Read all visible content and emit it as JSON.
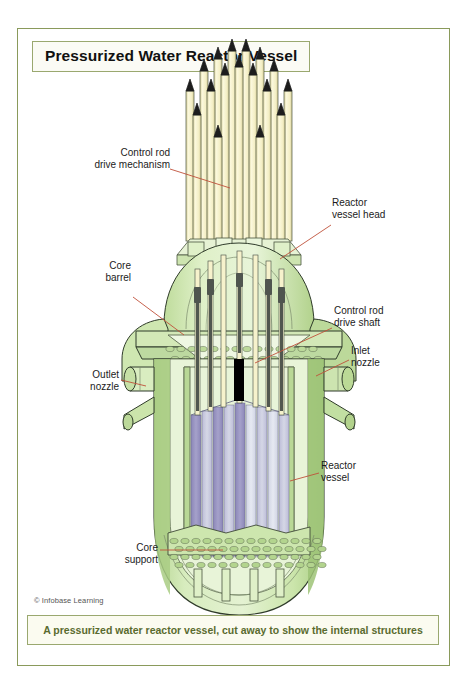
{
  "figure": {
    "title": "Pressurized Water Reactor Vessel",
    "caption": "A pressurized water reactor vessel, cut away to show the internal structures",
    "credit": "© Infobase Learning"
  },
  "colors": {
    "frame_border": "#8a9a5b",
    "title_border": "#9aa86f",
    "caption_text": "#5a6b2f",
    "caption_bg": "#fbfbf0",
    "vessel_green_light": "#dff0c8",
    "vessel_green_mid": "#c9e2a8",
    "vessel_green_dark": "#a9cd84",
    "rod_cream": "#f7f3cf",
    "rod_cream_dark": "#e8e2ad",
    "fuel_purple": "#9b97c4",
    "fuel_lavender": "#c6c6de",
    "fuel_pale": "#dfe2ee",
    "outline": "#2f3b2a",
    "leader_line": "#c0503a",
    "rod_tip_dark": "#1a1a1a",
    "shaft_grey": "#555a55",
    "black_marker": "#000000"
  },
  "callouts": [
    {
      "id": "control-rod-drive-mechanism",
      "label_line_1": "Control rod",
      "label_line_2": "drive mechanism",
      "side": "left",
      "text_x": 62,
      "text_y": 118,
      "leader": {
        "x1": 152,
        "y1": 140,
        "x2": 212,
        "y2": 159
      }
    },
    {
      "id": "reactor-vessel-head",
      "label_line_1": "Reactor",
      "label_line_2": "vessel head",
      "side": "right",
      "text_x": 314,
      "text_y": 168,
      "leader": {
        "x1": 313,
        "y1": 196,
        "x2": 262,
        "y2": 230
      }
    },
    {
      "id": "core-barrel",
      "label_line_1": "Core",
      "label_line_2": "barrel",
      "side": "left",
      "text_x": 70,
      "text_y": 231,
      "leader": {
        "x1": 115,
        "y1": 268,
        "x2": 166,
        "y2": 306
      }
    },
    {
      "id": "control-rod-drive-shaft",
      "label_line_1": "Control rod",
      "label_line_2": "drive shaft",
      "side": "right",
      "text_x": 316,
      "text_y": 276,
      "leader": {
        "x1": 314,
        "y1": 299,
        "x2": 237,
        "y2": 334
      }
    },
    {
      "id": "inlet-nozzle",
      "label_line_1": "Inlet",
      "label_line_2": "nozzle",
      "side": "right",
      "text_x": 333,
      "text_y": 316,
      "leader": {
        "x1": 331,
        "y1": 331,
        "x2": 298,
        "y2": 347
      }
    },
    {
      "id": "outlet-nozzle",
      "label_line_1": "Outlet",
      "label_line_2": "nozzle",
      "side": "left",
      "text_x": 58,
      "text_y": 340,
      "leader": {
        "x1": 103,
        "y1": 351,
        "x2": 128,
        "y2": 357
      }
    },
    {
      "id": "reactor-vessel",
      "label_line_1": "Reactor",
      "label_line_2": "vessel",
      "side": "right",
      "text_x": 303,
      "text_y": 431,
      "leader": {
        "x1": 301,
        "y1": 444,
        "x2": 272,
        "y2": 452
      }
    },
    {
      "id": "core-support",
      "label_line_1": "Core",
      "label_line_2": "support",
      "side": "left",
      "text_x": 96,
      "text_y": 513,
      "leader": {
        "x1": 142,
        "y1": 521,
        "x2": 205,
        "y2": 521
      }
    }
  ],
  "diagram": {
    "components": [
      "control rod drive mechanism rods",
      "reactor vessel head dome",
      "control rod drive shafts",
      "inlet nozzle",
      "outlet nozzle",
      "core barrel",
      "fuel assemblies",
      "core support",
      "reactor vessel body"
    ],
    "rod_count_visible": 13,
    "fuel_assembly_count_visible": 11
  }
}
